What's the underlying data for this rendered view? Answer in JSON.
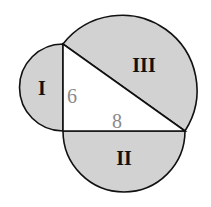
{
  "figure": {
    "type": "right-triangle-with-semicircles",
    "regions": [
      {
        "id": "I",
        "label": "I",
        "on_side": "leg_a"
      },
      {
        "id": "II",
        "label": "II",
        "on_side": "leg_b"
      },
      {
        "id": "III",
        "label": "III",
        "on_side": "hypotenuse"
      }
    ],
    "sides": {
      "leg_a": {
        "label": "6"
      },
      "leg_b": {
        "label": "8"
      }
    },
    "colors": {
      "fill": "#d2d2d2",
      "stroke": "#111111",
      "triangle_fill": "#ffffff",
      "side_label": "#8a8a8a"
    }
  }
}
